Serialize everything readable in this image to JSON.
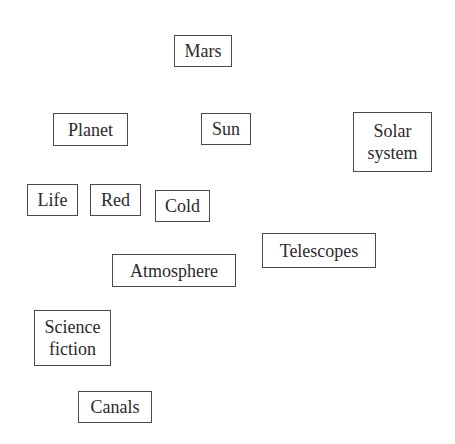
{
  "diagram": {
    "type": "concept-word-boxes",
    "nodes": [
      {
        "id": "mars",
        "label": "Mars",
        "x": 174,
        "y": 35,
        "w": 58,
        "h": 32
      },
      {
        "id": "planet",
        "label": "Planet",
        "x": 53,
        "y": 113,
        "w": 75,
        "h": 33
      },
      {
        "id": "sun",
        "label": "Sun",
        "x": 201,
        "y": 113,
        "w": 50,
        "h": 32
      },
      {
        "id": "solar-system",
        "label": "Solar\nsystem",
        "x": 353,
        "y": 112,
        "w": 79,
        "h": 60
      },
      {
        "id": "life",
        "label": "Life",
        "x": 27,
        "y": 184,
        "w": 51,
        "h": 32
      },
      {
        "id": "red",
        "label": "Red",
        "x": 90,
        "y": 184,
        "w": 51,
        "h": 32
      },
      {
        "id": "cold",
        "label": "Cold",
        "x": 155,
        "y": 190,
        "w": 55,
        "h": 32
      },
      {
        "id": "telescopes",
        "label": "Telescopes",
        "x": 262,
        "y": 233,
        "w": 114,
        "h": 35
      },
      {
        "id": "atmosphere",
        "label": "Atmosphere",
        "x": 112,
        "y": 254,
        "w": 124,
        "h": 33
      },
      {
        "id": "science-fiction",
        "label": "Science\nfiction",
        "x": 34,
        "y": 310,
        "w": 77,
        "h": 56
      },
      {
        "id": "canals",
        "label": "Canals",
        "x": 78,
        "y": 391,
        "w": 74,
        "h": 32
      }
    ]
  },
  "labels": {
    "mars": "Mars",
    "planet": "Planet",
    "sun": "Sun",
    "solar_system": "Solar\nsystem",
    "life": "Life",
    "red": "Red",
    "cold": "Cold",
    "telescopes": "Telescopes",
    "atmosphere": "Atmosphere",
    "science_fiction": "Science\nfiction",
    "canals": "Canals"
  },
  "colors": {
    "background": "#ffffff",
    "border": "#4a4a4a",
    "text": "#2a2a2a"
  }
}
